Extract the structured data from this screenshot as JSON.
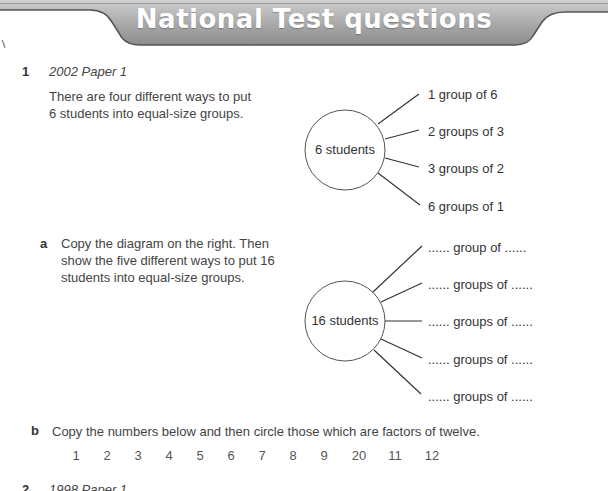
{
  "header": {
    "title": "National Test questions"
  },
  "question1": {
    "number": "1",
    "source": "2002 Paper 1",
    "intro": "There are four different ways to put 6 students into equal-size groups.",
    "example_diagram": {
      "center": "6 students",
      "branches": [
        "1 group of 6",
        "2 groups of 3",
        "3 groups of 2",
        "6 groups of 1"
      ]
    },
    "part_a": {
      "letter": "a",
      "text": "Copy the diagram on the right. Then show the five different ways to put 16 students into equal-size groups.",
      "diagram": {
        "center": "16 students",
        "branches": [
          "...... group of ......",
          "...... groups of ......",
          "...... groups of ......",
          "...... groups of ......",
          "...... groups of ......"
        ]
      }
    },
    "part_b": {
      "letter": "b",
      "text": "Copy the numbers below and then circle those which are factors of twelve.",
      "numbers": [
        "1",
        "2",
        "3",
        "4",
        "5",
        "6",
        "7",
        "8",
        "9",
        "20",
        "11",
        "12"
      ]
    }
  },
  "question2": {
    "number": "2",
    "source": "1998 Paper 1"
  },
  "colors": {
    "banner_fill": "#a9a9a9",
    "banner_line": "#555555",
    "text": "#444444"
  }
}
